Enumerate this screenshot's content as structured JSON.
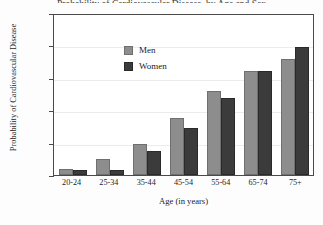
{
  "title": "Probability of Cardiovascular Disease, by Age and Sex",
  "axes": {
    "ylabel": "Probability of Cardiovascular Disease",
    "xlabel": "Age (in years)",
    "yticks": [
      "1.0",
      "0.8",
      "0.6",
      "0.4",
      "0.2",
      "0"
    ]
  },
  "legend": {
    "items": [
      {
        "label": "Men",
        "color": "#8d8d8d"
      },
      {
        "label": "Women",
        "color": "#3b3b3b"
      }
    ]
  },
  "chart_data": {
    "type": "bar",
    "title": "Probability of Cardiovascular Disease, by Age and Sex",
    "xlabel": "Age (in years)",
    "ylabel": "Probability of Cardiovascular Disease",
    "categories": [
      "20-24",
      "25-34",
      "35-44",
      "45-54",
      "55-64",
      "65-74",
      "75+"
    ],
    "series": [
      {
        "name": "Men",
        "color": "#8d8d8d",
        "values": [
          0.04,
          0.1,
          0.19,
          0.35,
          0.52,
          0.645,
          0.715
        ]
      },
      {
        "name": "Women",
        "color": "#3b3b3b",
        "values": [
          0.03,
          0.03,
          0.15,
          0.29,
          0.475,
          0.645,
          0.79
        ]
      }
    ],
    "ylim": [
      0,
      1.0
    ],
    "ytick_values": [
      0,
      0.2,
      0.4,
      0.6,
      0.8,
      1.0
    ],
    "grid": true,
    "legend_position": "upper-left-inside"
  }
}
